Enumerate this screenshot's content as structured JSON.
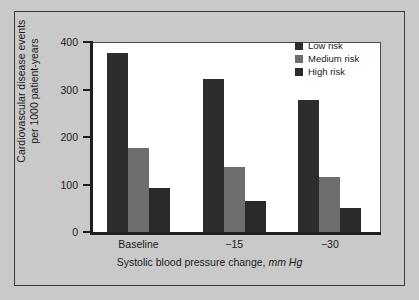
{
  "figure": {
    "background_color": "#c9c9c9",
    "frame_color": "#3a3a3a",
    "plot_background": "#ffffff"
  },
  "chart_data": {
    "type": "bar",
    "title": "",
    "subtitle": "",
    "categories": [
      "Baseline",
      "−15",
      "−30"
    ],
    "series": [
      {
        "name": "Low risk",
        "values": [
          380,
          325,
          280
        ],
        "color": "#2d2d2d"
      },
      {
        "name": "Medium risk",
        "values": [
          180,
          140,
          117
        ],
        "color": "#6e6e6e"
      },
      {
        "name": "High risk",
        "values": [
          95,
          68,
          52
        ],
        "color": "#2a2a2a"
      }
    ],
    "xlabel": "Systolic blood pressure change, mm Hg",
    "xlabel_plain": "Systolic blood pressure change,",
    "xlabel_unit_italic": "mm Hg",
    "ylabel": "Cardiovascular disease events per 1000 patient-years",
    "ylabel_line1": "Cardiovascular disease events",
    "ylabel_line2": "per 1000 patient-years",
    "ylim": [
      0,
      400
    ],
    "yticks": [
      0,
      100,
      200,
      300,
      400
    ],
    "ytick_labels": [
      "0",
      "100",
      "200",
      "300",
      "400"
    ],
    "grid": false,
    "legend_position": "top-right",
    "legend_entries": [
      "Low risk",
      "Medium risk",
      "High risk"
    ]
  }
}
